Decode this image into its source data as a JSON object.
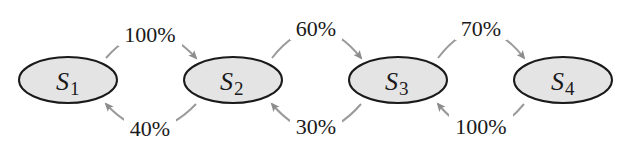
{
  "colors": {
    "background": "#ffffff",
    "node_fill": "#e4e4e4",
    "node_stroke": "#1a1a1a",
    "edge_color": "#9a9a9a",
    "text": "#1a1a1a"
  },
  "nodes": [
    {
      "id": "S1",
      "letter": "S",
      "subscript": "1"
    },
    {
      "id": "S2",
      "letter": "S",
      "subscript": "2"
    },
    {
      "id": "S3",
      "letter": "S",
      "subscript": "3"
    },
    {
      "id": "S4",
      "letter": "S",
      "subscript": "4"
    }
  ],
  "edges": [
    {
      "from": "S1",
      "to": "S2",
      "label": "100%",
      "position": "top"
    },
    {
      "from": "S2",
      "to": "S1",
      "label": "40%",
      "position": "bottom"
    },
    {
      "from": "S2",
      "to": "S3",
      "label": "60%",
      "position": "top"
    },
    {
      "from": "S3",
      "to": "S2",
      "label": "30%",
      "position": "bottom"
    },
    {
      "from": "S3",
      "to": "S4",
      "label": "70%",
      "position": "top"
    },
    {
      "from": "S4",
      "to": "S3",
      "label": "100%",
      "position": "bottom"
    }
  ]
}
